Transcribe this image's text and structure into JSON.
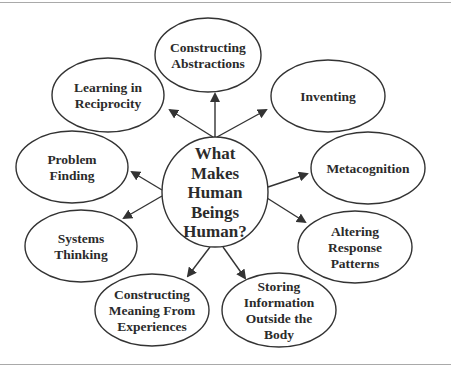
{
  "diagram": {
    "type": "radial-concept-map",
    "colors": {
      "stroke": "#333333",
      "text": "#2b2b2b",
      "background": "#ffffff",
      "frame": "#a9a9a9"
    },
    "center": {
      "id": "center",
      "lines": [
        "What",
        "Makes",
        "Human",
        "Beings",
        "Human?"
      ],
      "cx": 215,
      "cy": 192,
      "rx": 53,
      "ry": 55
    },
    "nodes": [
      {
        "id": "constructing-abstractions",
        "lines": [
          "Constructing",
          "Abstractions"
        ],
        "cx": 208,
        "cy": 55,
        "rx": 53,
        "ry": 37,
        "arrow_from": [
          215,
          137
        ],
        "arrow_to": [
          215,
          94
        ]
      },
      {
        "id": "learning-in-reciprocity",
        "lines": [
          "Learning in",
          "Reciprocity"
        ],
        "cx": 108,
        "cy": 95,
        "rx": 56,
        "ry": 37,
        "arrow_from": [
          213,
          137
        ],
        "arrow_to": [
          170,
          110
        ]
      },
      {
        "id": "inventing",
        "lines": [
          "Inventing"
        ],
        "cx": 328,
        "cy": 96,
        "rx": 57,
        "ry": 36,
        "arrow_from": [
          217,
          137
        ],
        "arrow_to": [
          266,
          110
        ]
      },
      {
        "id": "problem-finding",
        "lines": [
          "Problem",
          "Finding"
        ],
        "cx": 72,
        "cy": 167,
        "rx": 56,
        "ry": 36,
        "arrow_from": [
          162,
          190
        ],
        "arrow_to": [
          132,
          172
        ]
      },
      {
        "id": "metacognition",
        "lines": [
          "Metacognition"
        ],
        "cx": 368,
        "cy": 168,
        "rx": 57,
        "ry": 36,
        "arrow_from": [
          268,
          187
        ],
        "arrow_to": [
          307,
          174
        ]
      },
      {
        "id": "systems-thinking",
        "lines": [
          "Systems",
          "Thinking"
        ],
        "cx": 81,
        "cy": 246,
        "rx": 56,
        "ry": 36,
        "arrow_from": [
          162,
          196
        ],
        "arrow_to": [
          124,
          218
        ]
      },
      {
        "id": "altering-response-patterns",
        "lines": [
          "Altering",
          "Response",
          "Patterns"
        ],
        "cx": 355,
        "cy": 247,
        "rx": 57,
        "ry": 36,
        "arrow_from": [
          267,
          198
        ],
        "arrow_to": [
          305,
          222
        ]
      },
      {
        "id": "constructing-meaning-from-experiences",
        "lines": [
          "Constructing",
          "Meaning From",
          "Experiences"
        ],
        "cx": 152,
        "cy": 310,
        "rx": 57,
        "ry": 36,
        "arrow_from": [
          210,
          247
        ],
        "arrow_to": [
          188,
          276
        ]
      },
      {
        "id": "storing-information-outside-the-body",
        "lines": [
          "Storing",
          "Information",
          "Outside  the",
          "Body"
        ],
        "cx": 279,
        "cy": 310,
        "rx": 57,
        "ry": 37,
        "arrow_from": [
          223,
          247
        ],
        "arrow_to": [
          245,
          278
        ]
      }
    ]
  }
}
